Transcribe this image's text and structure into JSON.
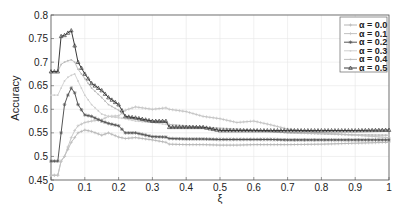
{
  "chart_data": {
    "type": "line",
    "title": "",
    "xlabel": "ξ",
    "ylabel": "Accuracy",
    "xlim": [
      0,
      1
    ],
    "ylim": [
      0.45,
      0.8
    ],
    "grid": true,
    "legend_position": "upper right",
    "x_ticks": [
      "0",
      "0.1",
      "0.2",
      "0.3",
      "0.4",
      "0.5",
      "0.6",
      "0.7",
      "0.8",
      "0.9",
      "1"
    ],
    "y_ticks": [
      "0.45",
      "0.5",
      "0.55",
      "0.6",
      "0.65",
      "0.7",
      "0.75",
      "0.8"
    ],
    "x": [
      0,
      0.02,
      0.03,
      0.04,
      0.05,
      0.06,
      0.07,
      0.08,
      0.1,
      0.12,
      0.15,
      0.17,
      0.2,
      0.22,
      0.25,
      0.3,
      0.34,
      0.35,
      0.4,
      0.45,
      0.5,
      0.55,
      0.6,
      0.65,
      0.7,
      0.8,
      0.9,
      1.0
    ],
    "series": [
      {
        "name": "α = 0.0",
        "color": "#b5b5b5",
        "marker": "plus",
        "values": [
          0.46,
          0.46,
          0.49,
          0.5,
          0.515,
          0.53,
          0.54,
          0.55,
          0.556,
          0.553,
          0.545,
          0.55,
          0.541,
          0.538,
          0.54,
          0.535,
          0.53,
          0.526,
          0.525,
          0.525,
          0.524,
          0.524,
          0.525,
          0.525,
          0.525,
          0.526,
          0.528,
          0.53
        ]
      },
      {
        "name": "α = 0.1",
        "color": "#c2c2c2",
        "marker": "plus",
        "values": [
          0.46,
          0.46,
          0.49,
          0.5,
          0.52,
          0.54,
          0.555,
          0.565,
          0.572,
          0.575,
          0.578,
          0.585,
          0.586,
          0.598,
          0.605,
          0.6,
          0.603,
          0.6,
          0.595,
          0.585,
          0.58,
          0.572,
          0.575,
          0.567,
          0.558,
          0.55,
          0.545,
          0.54
        ]
      },
      {
        "name": "α = 0.2",
        "color": "#555555",
        "marker": "asterisk",
        "values": [
          0.49,
          0.49,
          0.55,
          0.61,
          0.63,
          0.645,
          0.635,
          0.61,
          0.588,
          0.585,
          0.575,
          0.57,
          0.565,
          0.55,
          0.55,
          0.542,
          0.541,
          0.538,
          0.537,
          0.537,
          0.536,
          0.536,
          0.536,
          0.536,
          0.535,
          0.535,
          0.535,
          0.535
        ]
      },
      {
        "name": "α = 0.3",
        "color": "#cfcfcf",
        "marker": "dot",
        "values": [
          0.63,
          0.63,
          0.645,
          0.66,
          0.668,
          0.672,
          0.675,
          0.66,
          0.63,
          0.61,
          0.59,
          0.585,
          0.582,
          0.58,
          0.575,
          0.572,
          0.568,
          0.565,
          0.563,
          0.56,
          0.558,
          0.556,
          0.555,
          0.553,
          0.55,
          0.548,
          0.545,
          0.545
        ]
      },
      {
        "name": "α = 0.4",
        "color": "#bcbcbc",
        "marker": "dot",
        "values": [
          0.68,
          0.68,
          0.695,
          0.7,
          0.703,
          0.705,
          0.7,
          0.685,
          0.665,
          0.645,
          0.625,
          0.61,
          0.598,
          0.585,
          0.58,
          0.575,
          0.572,
          0.568,
          0.565,
          0.562,
          0.56,
          0.558,
          0.556,
          0.553,
          0.55,
          0.548,
          0.546,
          0.545
        ]
      },
      {
        "name": "α = 0.5",
        "color": "#3a3a3a",
        "marker": "triangle",
        "values": [
          0.68,
          0.68,
          0.755,
          0.757,
          0.762,
          0.767,
          0.735,
          0.7,
          0.675,
          0.655,
          0.64,
          0.625,
          0.61,
          0.585,
          0.582,
          0.575,
          0.575,
          0.562,
          0.562,
          0.562,
          0.555,
          0.555,
          0.555,
          0.555,
          0.555,
          0.555,
          0.555,
          0.556
        ]
      }
    ]
  },
  "legend": {
    "items": [
      "α = 0.0",
      "α = 0.1",
      "α = 0.2",
      "α = 0.3",
      "α = 0.4",
      "α = 0.5"
    ]
  }
}
